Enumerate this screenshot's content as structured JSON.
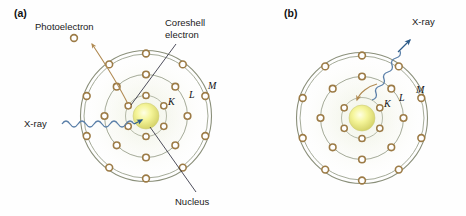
{
  "figure": {
    "background_color": "#ffffff"
  },
  "colors": {
    "nucleus_core": "#ffffcc",
    "nucleus_mid": "#eeee88",
    "nucleus_edge": "#cfcf6a",
    "electron_ring": "#9c7b46",
    "electron_fill": "#ffffff",
    "shell_stroke": "#8a8f7a",
    "shell_halo": "#eef1e6",
    "xray_wave": "#5a7fa8",
    "xray_arrow": "#2f5d8a",
    "transition_arrow": "#b08a52",
    "leader_line": "#3a3a4a",
    "text": "#1a1a1a"
  },
  "panels": [
    {
      "id": "a",
      "label": "(a)",
      "label_pos": {
        "x": 14,
        "y": 16
      },
      "process": "photoelectric-absorption",
      "center": {
        "x": 146,
        "y": 116
      },
      "shells": [
        {
          "name": "K",
          "radius": 20,
          "label": "K",
          "label_pos": {
            "x": 168,
            "y": 104
          }
        },
        {
          "name": "L",
          "radius": 42,
          "label": "L",
          "label_pos": {
            "x": 190,
            "y": 97
          }
        },
        {
          "name": "M",
          "radius": 64,
          "label": "M",
          "label_pos": {
            "x": 210,
            "y": 88
          }
        }
      ],
      "nucleus_radius": 13,
      "electrons": {
        "inner_shell_count": 6,
        "middle_shell_count": 8,
        "outer_shell_count": 10,
        "total": 24
      },
      "annotations": [
        {
          "name": "photoelectron",
          "text": "Photoelectron",
          "x": 36,
          "y": 30
        },
        {
          "name": "coreshell-electron",
          "text": "Coreshell",
          "x": 164,
          "y": 27
        },
        {
          "name": "coreshell-electron-line2",
          "text": "electron",
          "x": 164,
          "y": 39
        },
        {
          "name": "xray-incoming",
          "text": "X-ray",
          "x": 26,
          "y": 124
        },
        {
          "name": "nucleus",
          "text": "Nucleus",
          "x": 186,
          "y": 205
        }
      ],
      "ejected_electron": {
        "x": 74,
        "y": 38
      }
    },
    {
      "id": "b",
      "label": "(b)",
      "label_pos": {
        "x": 284,
        "y": 16
      },
      "process": "x-ray-fluorescence-emission",
      "center": {
        "x": 362,
        "y": 118
      },
      "shells": [
        {
          "name": "K",
          "radius": 20,
          "label": "K",
          "label_pos": {
            "x": 384,
            "y": 106
          }
        },
        {
          "name": "L",
          "radius": 42,
          "label": "L",
          "label_pos": {
            "x": 400,
            "y": 100
          }
        },
        {
          "name": "M",
          "radius": 64,
          "label": "M",
          "label_pos": {
            "x": 418,
            "y": 92
          }
        }
      ],
      "nucleus_radius": 13,
      "electrons": {
        "inner_shell_count": 5,
        "middle_shell_count": 8,
        "outer_shell_count": 10,
        "total": 23
      },
      "annotations": [
        {
          "name": "xray-outgoing",
          "text": "X-ray",
          "x": 419,
          "y": 22
        }
      ]
    }
  ]
}
